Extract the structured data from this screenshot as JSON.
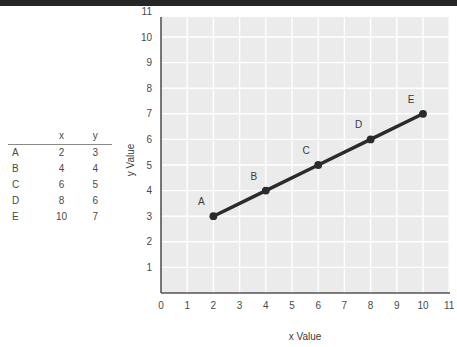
{
  "top_band": {
    "color": "#262626"
  },
  "table": {
    "columns": [
      "",
      "x",
      "y"
    ],
    "header_x": "x",
    "header_y": "y",
    "rows": [
      {
        "name": "A",
        "x": "2",
        "y": "3"
      },
      {
        "name": "B",
        "x": "4",
        "y": "4"
      },
      {
        "name": "C",
        "x": "6",
        "y": "5"
      },
      {
        "name": "D",
        "x": "8",
        "y": "6"
      },
      {
        "name": "E",
        "x": "10",
        "y": "7"
      }
    ]
  },
  "chart_data": {
    "type": "line",
    "title": "",
    "xlabel": "x Value",
    "ylabel": "y Value",
    "xlim": [
      0,
      11
    ],
    "ylim": [
      0,
      11
    ],
    "xticks": [
      "0",
      "1",
      "2",
      "3",
      "4",
      "5",
      "6",
      "7",
      "8",
      "9",
      "10",
      "11"
    ],
    "yticks": [
      "1",
      "2",
      "3",
      "4",
      "5",
      "6",
      "7",
      "8",
      "9",
      "10",
      "11"
    ],
    "grid": true,
    "legend": "none",
    "plot_bg": "#ebebeb",
    "grid_color": "#ffffff",
    "line_color": "#2b2b2b",
    "marker_color": "#2b2b2b",
    "x": [
      2,
      4,
      6,
      8,
      10
    ],
    "y": [
      3,
      4,
      5,
      6,
      7
    ],
    "point_labels": [
      "A",
      "B",
      "C",
      "D",
      "E"
    ],
    "series": [
      {
        "name": "",
        "values": [
          3,
          4,
          5,
          6,
          7
        ]
      }
    ]
  }
}
